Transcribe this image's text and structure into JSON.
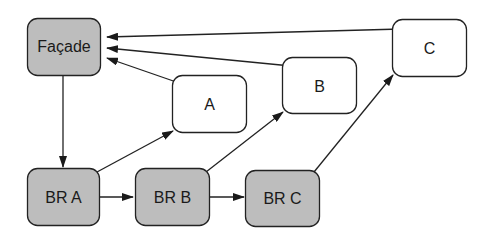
{
  "diagram": {
    "colors": {
      "shaded_fill": "#bdbdbd",
      "plain_fill": "#ffffff",
      "stroke": "#222222"
    },
    "nodes": {
      "facade": {
        "label": "Façade",
        "shaded": true
      },
      "a": {
        "label": "A",
        "shaded": false
      },
      "b": {
        "label": "B",
        "shaded": false
      },
      "c": {
        "label": "C",
        "shaded": false
      },
      "br_a": {
        "label": "BR A",
        "shaded": true
      },
      "br_b": {
        "label": "BR B",
        "shaded": true
      },
      "br_c": {
        "label": "BR C",
        "shaded": true
      }
    },
    "edges": [
      {
        "from": "Façade",
        "to": "BR A"
      },
      {
        "from": "BR A",
        "to": "BR B"
      },
      {
        "from": "BR B",
        "to": "BR C"
      },
      {
        "from": "BR A",
        "to": "A"
      },
      {
        "from": "BR B",
        "to": "B"
      },
      {
        "from": "BR C",
        "to": "C"
      },
      {
        "from": "A",
        "to": "Façade"
      },
      {
        "from": "B",
        "to": "Façade"
      },
      {
        "from": "C",
        "to": "Façade"
      }
    ]
  }
}
